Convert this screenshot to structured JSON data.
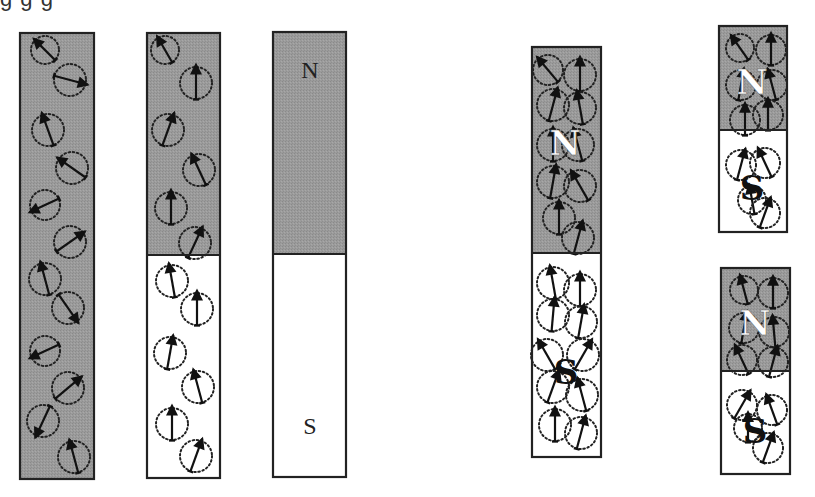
{
  "colors": {
    "magnetized_fill": "#9b9b9b",
    "unmagnetized_fill": "#ffffff",
    "stroke": "#222222"
  },
  "top_text_fragment": "g  g          g",
  "bars": [
    {
      "id": "bar-1-unmagnetized",
      "x": 20,
      "y": 33,
      "w": 74,
      "h": 446,
      "split": null,
      "fill_all": true,
      "labels": [],
      "domains": [
        {
          "cx": 45,
          "cy": 50,
          "r": 14,
          "angle": 225
        },
        {
          "cx": 70,
          "cy": 80,
          "r": 16,
          "angle": 15
        },
        {
          "cx": 48,
          "cy": 130,
          "r": 16,
          "angle": -110
        },
        {
          "cx": 72,
          "cy": 168,
          "r": 16,
          "angle": 215
        },
        {
          "cx": 45,
          "cy": 205,
          "r": 15,
          "angle": 155
        },
        {
          "cx": 70,
          "cy": 242,
          "r": 16,
          "angle": -35
        },
        {
          "cx": 45,
          "cy": 279,
          "r": 16,
          "angle": -105
        },
        {
          "cx": 68,
          "cy": 308,
          "r": 16,
          "angle": 55
        },
        {
          "cx": 45,
          "cy": 351,
          "r": 15,
          "angle": 155
        },
        {
          "cx": 68,
          "cy": 388,
          "r": 16,
          "angle": -40
        },
        {
          "cx": 43,
          "cy": 421,
          "r": 16,
          "angle": 115
        },
        {
          "cx": 74,
          "cy": 457,
          "r": 16,
          "angle": -105
        }
      ]
    },
    {
      "id": "bar-2-partially-aligned",
      "x": 147,
      "y": 33,
      "w": 73,
      "h": 445,
      "split": 255,
      "fill_all": false,
      "labels": [],
      "domains": [
        {
          "cx": 165,
          "cy": 50,
          "r": 14,
          "angle": -120
        },
        {
          "cx": 196,
          "cy": 83,
          "r": 16,
          "angle": -90
        },
        {
          "cx": 168,
          "cy": 130,
          "r": 16,
          "angle": -70
        },
        {
          "cx": 199,
          "cy": 170,
          "r": 16,
          "angle": -115
        },
        {
          "cx": 171,
          "cy": 208,
          "r": 16,
          "angle": -90
        },
        {
          "cx": 195,
          "cy": 243,
          "r": 16,
          "angle": -65
        },
        {
          "cx": 172,
          "cy": 281,
          "r": 16,
          "angle": -100
        },
        {
          "cx": 197,
          "cy": 309,
          "r": 16,
          "angle": -90
        },
        {
          "cx": 170,
          "cy": 353,
          "r": 16,
          "angle": -80
        },
        {
          "cx": 198,
          "cy": 387,
          "r": 16,
          "angle": -105
        },
        {
          "cx": 172,
          "cy": 424,
          "r": 16,
          "angle": -90
        },
        {
          "cx": 196,
          "cy": 456,
          "r": 16,
          "angle": -70
        }
      ]
    },
    {
      "id": "bar-3-magnet",
      "x": 273,
      "y": 32,
      "w": 73,
      "h": 445,
      "split": 254,
      "fill_all": false,
      "labels": [
        {
          "text": "N",
          "x": 310,
          "y": 78,
          "style": "plain"
        },
        {
          "text": "S",
          "x": 310,
          "y": 434,
          "style": "plain"
        }
      ],
      "domains": []
    },
    {
      "id": "bar-4-aligned-magnet",
      "x": 532,
      "y": 47,
      "w": 69,
      "h": 410,
      "split": 253,
      "fill_all": false,
      "labels": [
        {
          "text": "N",
          "x": 565,
          "y": 155,
          "style": "white"
        },
        {
          "text": "S",
          "x": 566,
          "y": 384,
          "style": "black"
        }
      ],
      "domains": [
        {
          "cx": 548,
          "cy": 70,
          "r": 15,
          "angle": -130
        },
        {
          "cx": 580,
          "cy": 75,
          "r": 16,
          "angle": -90
        },
        {
          "cx": 553,
          "cy": 105,
          "r": 16,
          "angle": -75
        },
        {
          "cx": 580,
          "cy": 108,
          "r": 16,
          "angle": -100
        },
        {
          "cx": 553,
          "cy": 145,
          "r": 16,
          "angle": -90
        },
        {
          "cx": 578,
          "cy": 145,
          "r": 16,
          "angle": -105
        },
        {
          "cx": 553,
          "cy": 182,
          "r": 16,
          "angle": -80
        },
        {
          "cx": 580,
          "cy": 186,
          "r": 16,
          "angle": -120
        },
        {
          "cx": 559,
          "cy": 218,
          "r": 16,
          "angle": -90
        },
        {
          "cx": 578,
          "cy": 238,
          "r": 16,
          "angle": -75
        },
        {
          "cx": 553,
          "cy": 283,
          "r": 16,
          "angle": -100
        },
        {
          "cx": 580,
          "cy": 290,
          "r": 16,
          "angle": -90
        },
        {
          "cx": 553,
          "cy": 315,
          "r": 16,
          "angle": -85
        },
        {
          "cx": 581,
          "cy": 322,
          "r": 16,
          "angle": -80
        },
        {
          "cx": 547,
          "cy": 355,
          "r": 16,
          "angle": -120
        },
        {
          "cx": 583,
          "cy": 355,
          "r": 16,
          "angle": -60
        },
        {
          "cx": 553,
          "cy": 387,
          "r": 16,
          "angle": -70
        },
        {
          "cx": 582,
          "cy": 395,
          "r": 16,
          "angle": -105
        },
        {
          "cx": 555,
          "cy": 425,
          "r": 16,
          "angle": -90
        },
        {
          "cx": 581,
          "cy": 433,
          "r": 16,
          "angle": -75
        }
      ]
    },
    {
      "id": "bar-5-broken-top",
      "x": 719,
      "y": 26,
      "w": 68,
      "h": 206,
      "split": 130,
      "fill_all": false,
      "labels": [
        {
          "text": "N",
          "x": 752,
          "y": 94,
          "style": "white"
        },
        {
          "text": "S",
          "x": 752,
          "y": 200,
          "style": "black"
        }
      ],
      "domains": [
        {
          "cx": 740,
          "cy": 48,
          "r": 14,
          "angle": -125
        },
        {
          "cx": 771,
          "cy": 50,
          "r": 15,
          "angle": -90
        },
        {
          "cx": 741,
          "cy": 85,
          "r": 15,
          "angle": -80
        },
        {
          "cx": 772,
          "cy": 85,
          "r": 15,
          "angle": -105
        },
        {
          "cx": 745,
          "cy": 120,
          "r": 15,
          "angle": -90
        },
        {
          "cx": 768,
          "cy": 115,
          "r": 15,
          "angle": -90
        },
        {
          "cx": 741,
          "cy": 165,
          "r": 15,
          "angle": -75
        },
        {
          "cx": 765,
          "cy": 163,
          "r": 15,
          "angle": -115
        },
        {
          "cx": 752,
          "cy": 200,
          "r": 14,
          "angle": -100
        },
        {
          "cx": 765,
          "cy": 213,
          "r": 15,
          "angle": -70
        }
      ]
    },
    {
      "id": "bar-6-broken-bottom",
      "x": 721,
      "y": 268,
      "w": 69,
      "h": 206,
      "split": 371,
      "fill_all": false,
      "labels": [
        {
          "text": "N",
          "x": 755,
          "y": 335,
          "style": "white"
        },
        {
          "text": "S",
          "x": 755,
          "y": 443,
          "style": "black"
        }
      ],
      "domains": [
        {
          "cx": 744,
          "cy": 290,
          "r": 14,
          "angle": -105
        },
        {
          "cx": 773,
          "cy": 293,
          "r": 15,
          "angle": -90
        },
        {
          "cx": 744,
          "cy": 328,
          "r": 15,
          "angle": -80
        },
        {
          "cx": 774,
          "cy": 332,
          "r": 15,
          "angle": -95
        },
        {
          "cx": 742,
          "cy": 360,
          "r": 15,
          "angle": -115
        },
        {
          "cx": 773,
          "cy": 362,
          "r": 15,
          "angle": -75
        },
        {
          "cx": 742,
          "cy": 405,
          "r": 15,
          "angle": -60
        },
        {
          "cx": 772,
          "cy": 410,
          "r": 15,
          "angle": -110
        },
        {
          "cx": 748,
          "cy": 428,
          "r": 14,
          "angle": -90
        },
        {
          "cx": 768,
          "cy": 448,
          "r": 15,
          "angle": -70
        }
      ]
    }
  ]
}
